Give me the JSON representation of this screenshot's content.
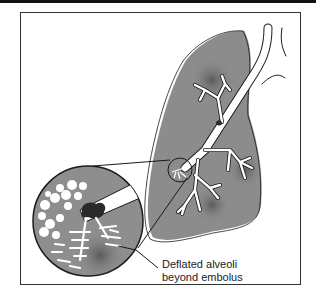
{
  "figure": {
    "type": "medical-illustration",
    "caption_lines": [
      "Deflated alveoli",
      "beyond embolus"
    ],
    "colors": {
      "lung_fill": "#8c8c8c",
      "lung_shadow": "#6a6a6a",
      "airway": "#ffffff",
      "outline": "#1a1a1a",
      "embolus": "#2a2a2a",
      "frame": "#333333",
      "background": "#ffffff"
    },
    "elements": [
      "lung",
      "bronchial-tree",
      "magnified-inset-circle",
      "embolus",
      "inflated-alveoli",
      "deflated-alveoli",
      "callout-line"
    ]
  }
}
